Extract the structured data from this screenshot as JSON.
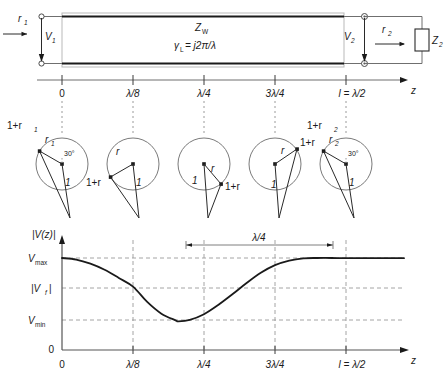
{
  "figure": {
    "type": "transmission-line-standing-wave-diagram",
    "line_section": {
      "characteristic_impedance_label": "Z",
      "characteristic_impedance_sub": "W",
      "propagation_label": "γ",
      "propagation_sub": "L",
      "propagation_value": "= j2π/λ",
      "source_reflection_label": "r",
      "source_reflection_sub": "1",
      "input_voltage_label": "V",
      "input_voltage_sub": "1",
      "output_voltage_label": "V",
      "output_voltage_sub": "2",
      "load_reflection_label": "r",
      "load_reflection_sub": "2",
      "load_impedance_label": "Z",
      "load_impedance_sub": "2"
    },
    "position_axis": {
      "axis_label": "z",
      "ticks": [
        "0",
        "λ/8",
        "λ/4",
        "3λ/4",
        "l = λ/2"
      ]
    },
    "phasor_circles": [
      {
        "name": "circle-z-0",
        "sum_label": "1+r",
        "sum_sub": "1",
        "vector_label": "r",
        "vector_sub": "1",
        "angle_label": "30°",
        "unit_label": "1",
        "r_angle_deg": 150
      },
      {
        "name": "circle-z-lambda-over-8",
        "sum_label": "1+r",
        "sum_sub": "",
        "vector_label": "r",
        "vector_sub": "",
        "angle_label": "",
        "unit_label": "1",
        "r_angle_deg": 210
      },
      {
        "name": "circle-z-lambda-over-4",
        "sum_label": "1+r",
        "sum_sub": "",
        "vector_label": "r",
        "vector_sub": "",
        "angle_label": "",
        "unit_label": "1",
        "r_angle_deg": 310
      },
      {
        "name": "circle-z-3lambda-over-4",
        "sum_label": "1+r",
        "sum_sub": "",
        "vector_label": "r",
        "vector_sub": "",
        "angle_label": "",
        "unit_label": "1",
        "r_angle_deg": 35
      },
      {
        "name": "circle-z-l-lambda-over-2",
        "sum_label": "1+r",
        "sum_sub": "2",
        "vector_label": "r",
        "vector_sub": "2",
        "angle_label": "30°",
        "unit_label": "1",
        "r_angle_deg": 150
      }
    ],
    "voltage_plot": {
      "y_axis_label": "|V(z)|",
      "x_axis_label": "z",
      "y_ticks": [
        "V",
        "|V",
        "V",
        "0"
      ],
      "y_tick_vmax": "V",
      "y_tick_vmax_sub": "max",
      "y_tick_vf": "|V",
      "y_tick_vf_sub": "f",
      "y_tick_vf_close": "|",
      "y_tick_vmin": "V",
      "y_tick_vmin_sub": "min",
      "y_tick_zero": "0",
      "x_ticks": [
        "0",
        "λ/8",
        "λ/4",
        "3λ/4",
        "l = λ/2"
      ],
      "dimension_label": "λ/4"
    }
  },
  "chart_data": {
    "type": "line",
    "title": "",
    "xlabel": "z",
    "ylabel": "|V(z)|",
    "x_tick_labels": [
      "0",
      "λ/8",
      "λ/4",
      "3λ/4",
      "l = λ/2"
    ],
    "x_tick_positions": [
      0,
      0.125,
      0.25,
      0.375,
      0.5
    ],
    "y_tick_labels": [
      "0",
      "V_min",
      "|V_f|",
      "V_max"
    ],
    "y_tick_values": [
      0,
      0.28,
      0.62,
      0.9
    ],
    "ylim": [
      0,
      1.0
    ],
    "xlim": [
      0,
      0.5
    ],
    "grid": "dashed",
    "annotation": {
      "label": "λ/4",
      "from_x": 0.205,
      "to_x": 0.455
    },
    "series": [
      {
        "name": "|V(z)|",
        "x": [
          0.0,
          0.025,
          0.05,
          0.075,
          0.1,
          0.125,
          0.15,
          0.175,
          0.2,
          0.205,
          0.225,
          0.25,
          0.275,
          0.3,
          0.325,
          0.35,
          0.375,
          0.4,
          0.425,
          0.45,
          0.475,
          0.5
        ],
        "y": [
          0.9,
          0.885,
          0.845,
          0.785,
          0.705,
          0.62,
          0.47,
          0.355,
          0.29,
          0.28,
          0.295,
          0.35,
          0.44,
          0.545,
          0.655,
          0.755,
          0.83,
          0.875,
          0.897,
          0.9,
          0.9,
          0.898
        ]
      }
    ]
  }
}
